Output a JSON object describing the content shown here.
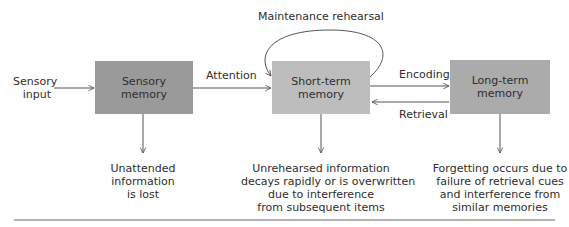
{
  "diagram": {
    "input_label": "Sensory\ninput",
    "boxes": [
      {
        "id": "sensory",
        "label_line1": "Sensory",
        "label_line2": "memory",
        "color": "#9a9a9a"
      },
      {
        "id": "short",
        "label_line1": "Short-term",
        "label_line2": "memory",
        "color": "#bdbdbd"
      },
      {
        "id": "long",
        "label_line1": "Long-term",
        "label_line2": "memory",
        "color": "#ababab"
      }
    ],
    "arrows": {
      "attention": "Attention",
      "maintenance": "Maintenance rehearsal",
      "encoding": "Encoding",
      "retrieval": "Retrieval"
    },
    "input": {
      "line1": "Sensory",
      "line2": "input"
    },
    "notes": {
      "sensory": [
        "Unattended",
        "information",
        "is lost"
      ],
      "short": [
        "Unrehearsed information",
        "decays rapidly or is overwritten",
        "due to interference",
        "from subsequent items"
      ],
      "long": [
        "Forgetting occurs due to",
        "failure of retrieval cues",
        "and interference from",
        "similar memories"
      ]
    },
    "line_color": "#555555"
  }
}
